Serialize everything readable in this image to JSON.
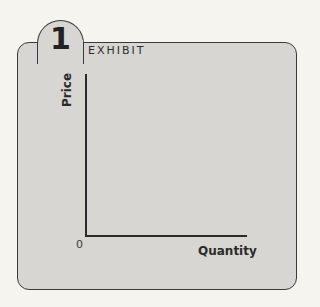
{
  "exhibit": {
    "number": "1",
    "label": "EXHIBIT"
  },
  "chart_data": {
    "type": "line",
    "xlabel": "Quantity",
    "ylabel": "Price",
    "origin_label": "0",
    "series": [],
    "grid": false,
    "legend": null
  }
}
